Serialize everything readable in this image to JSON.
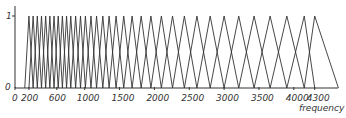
{
  "chart_data": {
    "type": "line",
    "title": "",
    "xlabel": "frequency",
    "ylabel": "",
    "ylim": [
      0,
      1
    ],
    "xlim": [
      0,
      4700
    ],
    "grid": false,
    "legend": null,
    "y_ticks": [
      "0",
      "1"
    ],
    "x_ticks": [
      "0",
      "200",
      "600",
      "1000",
      "1500",
      "2000",
      "2500",
      "3000",
      "3500",
      "4000",
      "4300"
    ],
    "x_tick_values": [
      0,
      200,
      600,
      1000,
      1500,
      2000,
      2500,
      3000,
      3500,
      4000,
      4300
    ],
    "centers": [
      200,
      260,
      320,
      380,
      440,
      500,
      560,
      620,
      680,
      740,
      800,
      870,
      940,
      1010,
      1090,
      1170,
      1260,
      1350,
      1450,
      1560,
      1680,
      1810,
      1950,
      2100,
      2260,
      2430,
      2610,
      2800,
      3000,
      3210,
      3430,
      3660,
      3900,
      4150,
      4300
    ],
    "first_edge": 140,
    "last_edge": 4640
  },
  "colors": {
    "line": "#333333",
    "axis": "#333333"
  }
}
